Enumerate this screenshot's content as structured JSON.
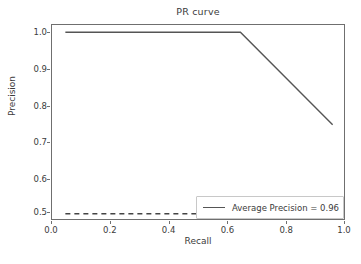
{
  "chart_data": {
    "type": "line",
    "title": "PR curve",
    "xlabel": "Recall",
    "ylabel": "Precision",
    "xlim": [
      -0.05,
      1.05
    ],
    "ylim": [
      0.48,
      1.02
    ],
    "grid": false,
    "legend_position": "lower right",
    "xticks": [
      {
        "value": 0.0,
        "label": "0.0"
      },
      {
        "value": 0.2,
        "label": "0.2"
      },
      {
        "value": 0.4,
        "label": "0.4"
      },
      {
        "value": 0.6,
        "label": "0.6"
      },
      {
        "value": 0.8,
        "label": "0.8"
      },
      {
        "value": 1.0,
        "label": "1.0"
      }
    ],
    "yticks": [
      {
        "value": 1.0,
        "label": "1.0"
      },
      {
        "value": 0.9,
        "label": "0.9"
      },
      {
        "value": 0.8,
        "label": "0.8"
      },
      {
        "value": 0.7,
        "label": "0.7"
      },
      {
        "value": 0.6,
        "label": "0.6"
      },
      {
        "value": 0.5,
        "label": "0.5"
      }
    ],
    "series": [
      {
        "name": "Average Precision = 0.96",
        "style": "solid",
        "color": "#555555",
        "x": [
          0.0,
          0.655,
          1.0
        ],
        "values": [
          1.0,
          1.0,
          0.745
        ]
      },
      {
        "name": "baseline",
        "style": "dashed",
        "color": "#444444",
        "x": [
          0.0,
          1.0
        ],
        "values": [
          0.5,
          0.5
        ]
      }
    ],
    "annotations": []
  },
  "legend": {
    "entries": [
      {
        "label": "Average Precision = 0.96",
        "swatch_color": "#555555"
      }
    ]
  },
  "colors": {
    "curve": "#555555",
    "baseline": "#444444",
    "axis": "#6f6f6f",
    "text": "#3b3b3b",
    "background": "#ffffff",
    "legend_border": "#c8c8c8"
  }
}
